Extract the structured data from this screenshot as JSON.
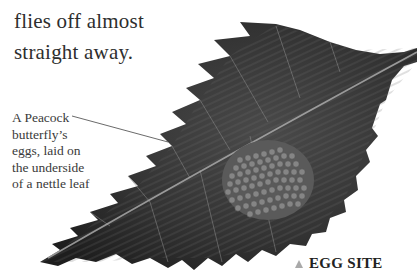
{
  "body_text": {
    "lines": [
      "flies off almost",
      "straight away."
    ]
  },
  "figure": {
    "caption_lines": [
      "A Peacock",
      "butterfly’s",
      "eggs, laid on",
      "the underside",
      "of a nettle leaf"
    ]
  },
  "section_label": {
    "icon": "triangle-up-icon",
    "text": "EGG SITE"
  },
  "colors": {
    "leaf_dark": "#2b2b2b",
    "leaf_mid": "#555555",
    "eggs": "#7d7d7d",
    "triangle": "#a9a9a9"
  }
}
